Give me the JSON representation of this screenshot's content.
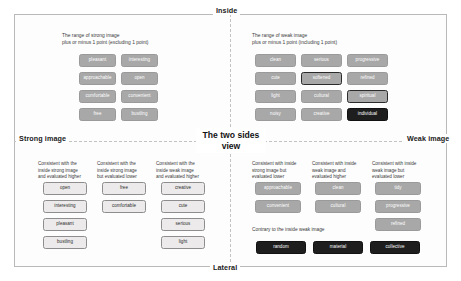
{
  "poles": {
    "top": "Inside",
    "bottom": "Lateral",
    "left": "Strong image",
    "right": "Weak image"
  },
  "center_label": "The two\nsides view",
  "quadrants": {
    "top_left": {
      "caption": "The range of strong image\nplus or minus 1 point (excluding 1 point)",
      "chips": [
        {
          "label": "pleasant",
          "style": "grey"
        },
        {
          "label": "interesting",
          "style": "grey"
        },
        {
          "label": "approachable",
          "style": "grey"
        },
        {
          "label": "open",
          "style": "grey"
        },
        {
          "label": "comfortable",
          "style": "grey"
        },
        {
          "label": "convenient",
          "style": "grey"
        },
        {
          "label": "free",
          "style": "grey"
        },
        {
          "label": "bustling",
          "style": "grey"
        }
      ]
    },
    "top_right": {
      "caption": "The range of weak image\nplus or minus 1 point (including 1 point)",
      "chips": [
        {
          "label": "clean",
          "style": "grey"
        },
        {
          "label": "serious",
          "style": "grey"
        },
        {
          "label": "progressive",
          "style": "grey"
        },
        {
          "label": "cute",
          "style": "grey"
        },
        {
          "label": "softened",
          "style": "grey-out"
        },
        {
          "label": "refined",
          "style": "grey"
        },
        {
          "label": "light",
          "style": "grey"
        },
        {
          "label": "cultural",
          "style": "grey"
        },
        {
          "label": "spiritual",
          "style": "grey-out"
        },
        {
          "label": "noisy",
          "style": "grey"
        },
        {
          "label": "creative",
          "style": "grey"
        },
        {
          "label": "individual",
          "style": "dark"
        }
      ]
    },
    "bottom_left": {
      "columns": [
        {
          "header": "Consistent with the\ninside strong image\nand evaluated higher",
          "chips": [
            {
              "label": "open",
              "style": "light"
            },
            {
              "label": "interesting",
              "style": "light"
            },
            {
              "label": "pleasant",
              "style": "light"
            },
            {
              "label": "bustling",
              "style": "light"
            }
          ]
        },
        {
          "header": "Consistent with the\ninside strong image\nbut evaluated lower",
          "chips": [
            {
              "label": "free",
              "style": "light"
            },
            {
              "label": "comfortable",
              "style": "light"
            }
          ]
        },
        {
          "header": "Consistent with the\ninside weak image\nand evaluated higher",
          "chips": [
            {
              "label": "creative",
              "style": "light"
            },
            {
              "label": "cute",
              "style": "light"
            },
            {
              "label": "serious",
              "style": "light"
            },
            {
              "label": "light",
              "style": "light"
            }
          ]
        }
      ]
    },
    "bottom_right": {
      "columns": [
        {
          "header": "Consistent with inside\nstrong image but\nevaluated lower",
          "chips": [
            {
              "label": "approachable",
              "style": "grey"
            },
            {
              "label": "convenient",
              "style": "grey"
            }
          ]
        },
        {
          "header": "Consistent with inside\nweak image and\nevaluated higher",
          "chips": [
            {
              "label": "clean",
              "style": "grey"
            },
            {
              "label": "cultural",
              "style": "grey"
            }
          ]
        },
        {
          "header": "Consistent with inside\nweak image but\nevaluated lower",
          "chips": [
            {
              "label": "tidy",
              "style": "grey"
            },
            {
              "label": "progressive",
              "style": "grey"
            },
            {
              "label": "refined",
              "style": "grey"
            }
          ]
        }
      ],
      "contrary_note": "Contrary to the inside weak image",
      "contrary_chips": [
        {
          "label": "random",
          "style": "dark"
        },
        {
          "label": "material",
          "style": "dark"
        },
        {
          "label": "collective",
          "style": "dark"
        }
      ]
    }
  }
}
